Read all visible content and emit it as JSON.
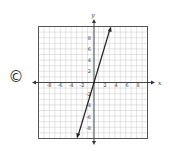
{
  "choice": {
    "label": "©"
  },
  "chart_data": {
    "type": "line",
    "title": "",
    "xlabel": "x",
    "ylabel": "y",
    "xlim": [
      -10,
      10
    ],
    "ylim": [
      -10,
      10
    ],
    "grid": true,
    "x_tick_labels": [
      "-8",
      "-6",
      "-4",
      "-2",
      "2",
      "4",
      "6",
      "8"
    ],
    "y_tick_labels": [
      "8",
      "6",
      "4",
      "2",
      "-2",
      "-4",
      "-6",
      "-8"
    ],
    "series": [
      {
        "name": "line",
        "equation": "y = 3x",
        "points": [
          [
            -3.3,
            -10
          ],
          [
            3.3,
            10
          ]
        ],
        "arrows": "both"
      }
    ]
  }
}
